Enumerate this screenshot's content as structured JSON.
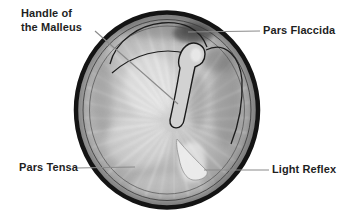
{
  "diagram": {
    "labels": {
      "handle_of_malleus_line1": "Handle of",
      "handle_of_malleus_line2": "the Malleus",
      "pars_flaccida": "Pars Flaccida",
      "pars_tensa": "Pars Tensa",
      "light_reflex": "Light Reflex"
    },
    "colors": {
      "background": "#ffffff",
      "outline_ink": "#141414",
      "label_text": "#1f1f1f",
      "leader_line": "#8a8a8a",
      "membrane_center": "#d8d8d8",
      "membrane_edge": "#828282",
      "pars_flaccida_shadow": "#4f4f4f",
      "malleus_fill": "#d2d2d2",
      "light_reflex_fill": "#ebebeb"
    }
  }
}
